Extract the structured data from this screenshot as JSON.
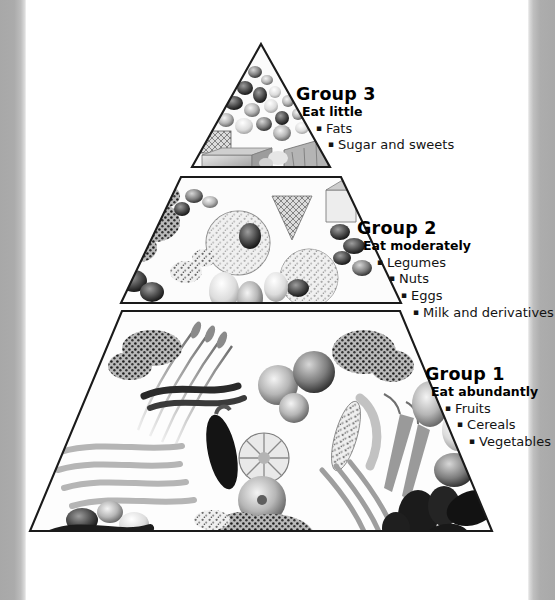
{
  "figure": {
    "kind": "food-pyramid",
    "background_color": "#ffffff",
    "outline_color": "#1a1a1a",
    "edge_band_color": "#ababab",
    "bullet_glyph": "▪"
  },
  "tiers": [
    {
      "id": "tier-3",
      "position": "apex",
      "title": "Group 3",
      "advice": "Eat little",
      "items": [
        "Fats",
        "Sugar and sweets"
      ],
      "contents_depicted": [
        "candies",
        "sweets",
        "butter",
        "chocolate bar",
        "waffle",
        "oil"
      ]
    },
    {
      "id": "tier-2",
      "position": "middle",
      "title": "Group 2",
      "advice": "Eat moderately",
      "items": [
        "Legumes",
        "Nuts",
        "Eggs",
        "Milk and derivatives"
      ],
      "contents_depicted": [
        "cheese wheel",
        "eggs",
        "beans",
        "nuts",
        "rice",
        "milk",
        "lentils"
      ]
    },
    {
      "id": "tier-1",
      "position": "base",
      "title": "Group 1",
      "advice": "Eat abundantly",
      "items": [
        "Fruits",
        "Cereals",
        "Vegetables"
      ],
      "contents_depicted": [
        "carrots",
        "eggplant",
        "apples",
        "green beans",
        "wheat stalks",
        "squash",
        "broccoli",
        "peppers",
        "grapes",
        "onions",
        "leeks",
        "corn"
      ]
    }
  ]
}
